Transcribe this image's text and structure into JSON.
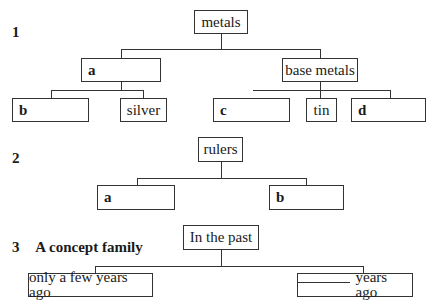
{
  "header": {
    "cut_text": "Complete the diagrams"
  },
  "diagram1": {
    "number": "1",
    "root": "metals",
    "left_branch": {
      "label": "a",
      "children": [
        "b",
        "silver"
      ]
    },
    "right_branch": {
      "label": "base metals",
      "children": [
        "c",
        "tin",
        "d"
      ]
    }
  },
  "diagram2": {
    "number": "2",
    "root": "rulers",
    "children": [
      "a",
      "b"
    ]
  },
  "diagram3": {
    "number": "3",
    "title": "A concept family",
    "root": "In the past",
    "children": [
      "only a few years ago",
      "years ago"
    ],
    "blank_placeholder": "______"
  }
}
